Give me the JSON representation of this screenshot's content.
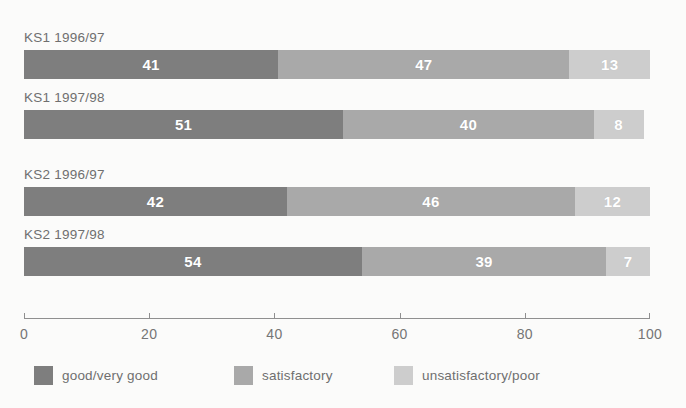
{
  "chart_data": {
    "type": "bar",
    "orientation": "horizontal",
    "stacked": true,
    "title": "",
    "xlabel": "",
    "ylabel": "",
    "xlim": [
      0,
      100
    ],
    "xticks": [
      0,
      20,
      40,
      60,
      80,
      100
    ],
    "xtick_labels": [
      "0",
      "20",
      "40",
      "60",
      "80",
      "100"
    ],
    "grid": false,
    "legend_position": "bottom-left",
    "categories": [
      "KS1 1996/97",
      "KS1 1997/98",
      "KS2 1996/97",
      "KS2 1997/98"
    ],
    "series": [
      {
        "name": "good/very good",
        "color": "#7e7e7e",
        "values": [
          41,
          51,
          42,
          54
        ]
      },
      {
        "name": "satisfactory",
        "color": "#a9a9a9",
        "values": [
          47,
          40,
          46,
          39
        ]
      },
      {
        "name": "unsatisfactory/poor",
        "color": "#cdcdcd",
        "values": [
          13,
          8,
          12,
          7
        ]
      }
    ]
  },
  "groups": [
    {
      "bars": [
        {
          "label": "KS1 1996/97",
          "segments": [
            {
              "value": "41",
              "pct": 41
            },
            {
              "value": "47",
              "pct": 47
            },
            {
              "value": "13",
              "pct": 13
            }
          ]
        },
        {
          "label": "KS1 1997/98",
          "segments": [
            {
              "value": "51",
              "pct": 51
            },
            {
              "value": "40",
              "pct": 40
            },
            {
              "value": "8",
              "pct": 8
            }
          ]
        }
      ]
    },
    {
      "bars": [
        {
          "label": "KS2 1996/97",
          "segments": [
            {
              "value": "42",
              "pct": 42
            },
            {
              "value": "46",
              "pct": 46
            },
            {
              "value": "12",
              "pct": 12
            }
          ]
        },
        {
          "label": "KS2 1997/98",
          "segments": [
            {
              "value": "54",
              "pct": 54
            },
            {
              "value": "39",
              "pct": 39
            },
            {
              "value": "7",
              "pct": 7
            }
          ]
        }
      ]
    }
  ],
  "axis": {
    "ticks": [
      "0",
      "20",
      "40",
      "60",
      "80",
      "100"
    ]
  },
  "legend": {
    "items": [
      {
        "label": "good/very good",
        "color": "#7e7e7e"
      },
      {
        "label": "satisfactory",
        "color": "#a9a9a9"
      },
      {
        "label": "unsatisfactory/poor",
        "color": "#cdcdcd"
      }
    ]
  },
  "top_clipped_text": "",
  "colors": {
    "background": "#fbfbfa",
    "axis": "#8f8f8f",
    "label_text": "#6f6f6f",
    "tick_text": "#757575",
    "value_text": "#ffffff",
    "series_dark": "#7e7e7e",
    "series_mid": "#a9a9a9",
    "series_light": "#cdcdcd"
  }
}
